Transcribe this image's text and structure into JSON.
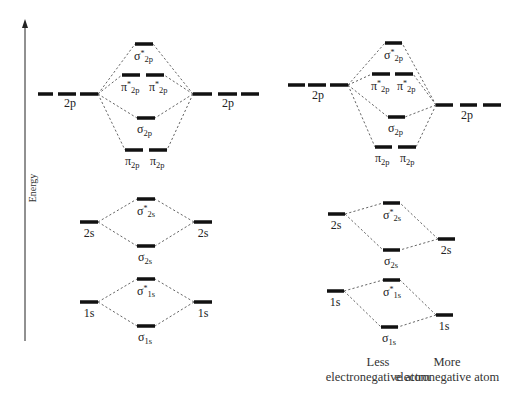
{
  "axis": {
    "label": "Energy",
    "x": 25,
    "y_top": 20,
    "y_bottom": 341
  },
  "diagrams": [
    {
      "name": "homonuclear",
      "atomic_levels": [
        {
          "id": "left-2p",
          "label": "2p",
          "y": 94,
          "segments": [
            [
              38,
              53
            ],
            [
              58,
              76
            ],
            [
              80,
              98
            ]
          ],
          "label_x": 70,
          "label_y": 107
        },
        {
          "id": "right-2p",
          "label": "2p",
          "y": 94,
          "segments": [
            [
              193,
              212
            ],
            [
              218,
              237
            ],
            [
              241,
              259
            ]
          ],
          "label_x": 228,
          "label_y": 107
        },
        {
          "id": "left-2s",
          "label": "2s",
          "y": 222,
          "segments": [
            [
              80,
              98
            ]
          ],
          "label_x": 89,
          "label_y": 237
        },
        {
          "id": "right-2s",
          "label": "2s",
          "y": 222,
          "segments": [
            [
              194,
              212
            ]
          ],
          "label_x": 203,
          "label_y": 237
        },
        {
          "id": "left-1s",
          "label": "1s",
          "y": 302,
          "segments": [
            [
              80,
              98
            ]
          ],
          "label_x": 89,
          "label_y": 317
        },
        {
          "id": "right-1s",
          "label": "1s",
          "y": 302,
          "segments": [
            [
              194,
              212
            ]
          ],
          "label_x": 203,
          "label_y": 317
        }
      ],
      "molecular_levels": [
        {
          "id": "sigma-star-2p",
          "sym": "σ",
          "star": true,
          "sub": "2p",
          "y": 44,
          "segments": [
            [
              135,
              153
            ]
          ],
          "label_x": 134,
          "label_y": 60
        },
        {
          "id": "pi-star-2p",
          "sym": "π",
          "star": true,
          "sub": "2p",
          "y": 75,
          "segments": [
            [
              122,
              140
            ],
            [
              146,
              164
            ]
          ],
          "label_x": [
            121,
            149
          ],
          "label_y": 91
        },
        {
          "id": "sigma-2p",
          "sym": "σ",
          "star": false,
          "sub": "2p",
          "y": 118,
          "segments": [
            [
              137,
              155
            ]
          ],
          "label_x": 137,
          "label_y": 133
        },
        {
          "id": "pi-2p",
          "sym": "π",
          "star": false,
          "sub": "2p",
          "y": 150,
          "segments": [
            [
              125,
              143
            ],
            [
              149,
              167
            ]
          ],
          "label_x": [
            125,
            150
          ],
          "label_y": 165
        },
        {
          "id": "sigma-star-2s",
          "sym": "σ",
          "star": true,
          "sub": "2s",
          "y": 199,
          "segments": [
            [
              137,
              155
            ]
          ],
          "label_x": 137,
          "label_y": 215
        },
        {
          "id": "sigma-2s",
          "sym": "σ",
          "star": false,
          "sub": "2s",
          "y": 246,
          "segments": [
            [
              137,
              155
            ]
          ],
          "label_x": 138,
          "label_y": 261
        },
        {
          "id": "sigma-star-1s",
          "sym": "σ",
          "star": true,
          "sub": "1s",
          "y": 279,
          "segments": [
            [
              137,
              155
            ]
          ],
          "label_x": 137,
          "label_y": 295
        },
        {
          "id": "sigma-1s",
          "sym": "σ",
          "star": false,
          "sub": "1s",
          "y": 326,
          "segments": [
            [
              137,
              155
            ]
          ],
          "label_x": 138,
          "label_y": 341
        }
      ],
      "connections": [
        [
          98,
          94,
          135,
          44
        ],
        [
          98,
          94,
          122,
          75
        ],
        [
          98,
          94,
          137,
          118
        ],
        [
          98,
          94,
          125,
          150
        ],
        [
          193,
          94,
          153,
          44
        ],
        [
          193,
          94,
          164,
          75
        ],
        [
          193,
          94,
          155,
          118
        ],
        [
          193,
          94,
          167,
          150
        ],
        [
          98,
          222,
          137,
          199
        ],
        [
          98,
          222,
          137,
          246
        ],
        [
          194,
          222,
          155,
          199
        ],
        [
          194,
          222,
          155,
          246
        ],
        [
          98,
          302,
          137,
          279
        ],
        [
          98,
          302,
          137,
          326
        ],
        [
          194,
          302,
          155,
          279
        ],
        [
          194,
          302,
          155,
          326
        ]
      ]
    },
    {
      "name": "heteronuclear",
      "atomic_levels": [
        {
          "id": "left-2p",
          "label": "2p",
          "y": 85,
          "segments": [
            [
              288,
              305
            ],
            [
              308,
              326
            ],
            [
              330,
              348
            ]
          ],
          "label_x": 318,
          "label_y": 99
        },
        {
          "id": "right-2p",
          "label": "2p",
          "y": 105,
          "segments": [
            [
              436,
              453
            ],
            [
              460,
              477
            ],
            [
              483,
              501
            ]
          ],
          "label_x": 467,
          "label_y": 119
        },
        {
          "id": "left-2s",
          "label": "2s",
          "y": 214,
          "segments": [
            [
              328,
              345
            ]
          ],
          "label_x": 336,
          "label_y": 229
        },
        {
          "id": "right-2s",
          "label": "2s",
          "y": 239,
          "segments": [
            [
              438,
              455
            ]
          ],
          "label_x": 446,
          "label_y": 254
        },
        {
          "id": "left-1s",
          "label": "1s",
          "y": 291,
          "segments": [
            [
              327,
              344
            ]
          ],
          "label_x": 335,
          "label_y": 306
        },
        {
          "id": "right-1s",
          "label": "1s",
          "y": 315,
          "segments": [
            [
              436,
              453
            ]
          ],
          "label_x": 444,
          "label_y": 330
        }
      ],
      "molecular_levels": [
        {
          "id": "sigma-star-2p",
          "sym": "σ",
          "star": true,
          "sub": "2p",
          "y": 43,
          "segments": [
            [
              385,
              402
            ]
          ],
          "label_x": 384,
          "label_y": 59
        },
        {
          "id": "pi-star-2p",
          "sym": "π",
          "star": true,
          "sub": "2p",
          "y": 74,
          "segments": [
            [
              372,
              390
            ],
            [
              395,
              413
            ]
          ],
          "label_x": [
            371,
            397
          ],
          "label_y": 90
        },
        {
          "id": "sigma-2p",
          "sym": "σ",
          "star": false,
          "sub": "2p",
          "y": 117,
          "segments": [
            [
              388,
              405
            ]
          ],
          "label_x": 388,
          "label_y": 132
        },
        {
          "id": "pi-2p",
          "sym": "π",
          "star": false,
          "sub": "2p",
          "y": 147,
          "segments": [
            [
              375,
              392
            ],
            [
              398,
              416
            ]
          ],
          "label_x": [
            375,
            400
          ],
          "label_y": 162
        },
        {
          "id": "sigma-star-2s",
          "sym": "σ",
          "star": true,
          "sub": "2s",
          "y": 203,
          "segments": [
            [
              383,
              400
            ]
          ],
          "label_x": 383,
          "label_y": 219
        },
        {
          "id": "sigma-2s",
          "sym": "σ",
          "star": false,
          "sub": "2s",
          "y": 250,
          "segments": [
            [
              383,
              400
            ]
          ],
          "label_x": 384,
          "label_y": 265
        },
        {
          "id": "sigma-star-1s",
          "sym": "σ",
          "star": true,
          "sub": "1s",
          "y": 280,
          "segments": [
            [
              383,
              400
            ]
          ],
          "label_x": 383,
          "label_y": 296
        },
        {
          "id": "sigma-1s",
          "sym": "σ",
          "star": false,
          "sub": "1s",
          "y": 327,
          "segments": [
            [
              381,
              398
            ]
          ],
          "label_x": 382,
          "label_y": 342
        }
      ],
      "connections": [
        [
          348,
          85,
          385,
          43
        ],
        [
          348,
          85,
          372,
          74
        ],
        [
          348,
          85,
          388,
          117
        ],
        [
          348,
          85,
          375,
          147
        ],
        [
          436,
          105,
          402,
          43
        ],
        [
          436,
          105,
          413,
          74
        ],
        [
          436,
          105,
          405,
          117
        ],
        [
          436,
          105,
          416,
          147
        ],
        [
          345,
          214,
          383,
          203
        ],
        [
          345,
          214,
          383,
          250
        ],
        [
          438,
          239,
          400,
          203
        ],
        [
          438,
          239,
          400,
          250
        ],
        [
          344,
          291,
          383,
          280
        ],
        [
          344,
          291,
          381,
          327
        ],
        [
          436,
          315,
          400,
          280
        ],
        [
          436,
          315,
          398,
          327
        ]
      ],
      "captions": [
        {
          "id": "less-electronegative",
          "lines": [
            "Less",
            "electronegative atom"
          ],
          "x": 378,
          "y": [
            366,
            381
          ]
        },
        {
          "id": "more-electronegative",
          "lines": [
            "More",
            "electronegative atom"
          ],
          "x": 447,
          "y": [
            366,
            381
          ]
        }
      ]
    }
  ]
}
